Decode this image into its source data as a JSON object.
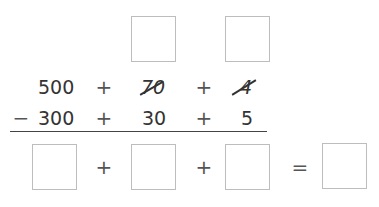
{
  "top_boxes": [
    {
      "id": "regroup-tens",
      "value": ""
    },
    {
      "id": "regroup-ones",
      "value": ""
    }
  ],
  "minuend": {
    "hundreds": "500",
    "tens": "70",
    "ones": "4",
    "tens_crossed": true,
    "ones_crossed": true
  },
  "subtrahend": {
    "sign": "−",
    "hundreds": "300",
    "tens": "30",
    "ones": "5"
  },
  "operators": {
    "plus": "+",
    "equals": "="
  },
  "answer_boxes": [
    {
      "id": "hundreds-answer",
      "value": ""
    },
    {
      "id": "tens-answer",
      "value": ""
    },
    {
      "id": "ones-answer",
      "value": ""
    },
    {
      "id": "total-answer",
      "value": ""
    }
  ]
}
